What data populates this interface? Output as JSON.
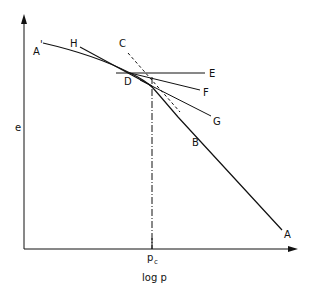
{
  "diagram": {
    "type": "e-log p consolidation curve (Casagrande construction)",
    "axes": {
      "y_label": "e",
      "x_label": "log p",
      "x_marker": "p",
      "x_marker_sub": "c"
    },
    "labels": {
      "A_prime": "A",
      "A_prime_mark": "'",
      "H": "H",
      "C": "C",
      "D": "D",
      "E": "E",
      "F": "F",
      "G": "G",
      "B": "B",
      "A": "A"
    },
    "colors": {
      "line": "#111111",
      "background": "#ffffff"
    }
  }
}
